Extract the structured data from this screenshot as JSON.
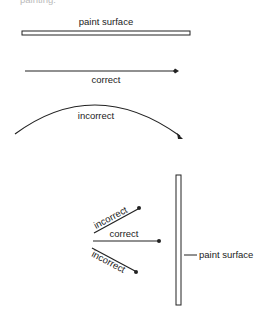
{
  "cropped_top_text": "painting.",
  "panel1": {
    "surface_label": "paint surface",
    "correct_label": "correct",
    "incorrect_label": "incorrect"
  },
  "panel2": {
    "surface_label": "paint surface",
    "upper_label": "incorrect",
    "middle_label": "correct",
    "lower_label": "incorrect"
  },
  "colors": {
    "ink": "#222222",
    "background": "#ffffff"
  }
}
